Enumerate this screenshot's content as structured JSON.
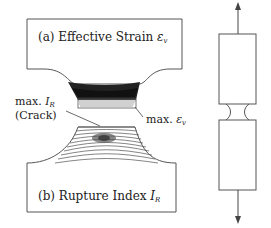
{
  "panel_a": {
    "prefix": "(a) Effective Strain ",
    "symbol": "ε",
    "subscript": "v"
  },
  "panel_b": {
    "prefix": "(b) Rupture Index ",
    "symbol": "I",
    "subscript": "R"
  },
  "annotation_ir": {
    "line1_prefix": "max. ",
    "line1_symbol": "I",
    "line1_sub": "R",
    "line2": "(Crack)"
  },
  "annotation_ev": {
    "prefix": "max. ",
    "symbol": "ε",
    "sub": "v"
  },
  "colors": {
    "outline": "#555555",
    "contour_dark": "#111111",
    "arrow": "#444444"
  }
}
